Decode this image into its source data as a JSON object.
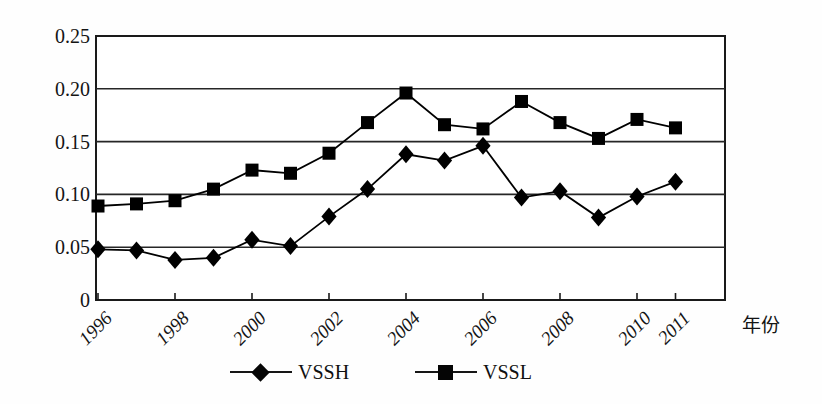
{
  "chart_data": {
    "type": "line",
    "title": "",
    "xlabel": "年份",
    "ylabel": "",
    "x": [
      1996,
      1997,
      1998,
      1999,
      2000,
      2001,
      2002,
      2003,
      2004,
      2005,
      2006,
      2007,
      2008,
      2009,
      2010,
      2011
    ],
    "xtick_labels": [
      "1996",
      "1998",
      "2000",
      "2002",
      "2004",
      "2006",
      "2008",
      "2010",
      "2011"
    ],
    "xtick_values": [
      1996,
      1998,
      2000,
      2002,
      2004,
      2006,
      2008,
      2010,
      2011
    ],
    "ytick_labels": [
      "0",
      "0.05",
      "0.10",
      "0.15",
      "0.20",
      "0.25"
    ],
    "ytick_values": [
      0,
      0.05,
      0.1,
      0.15,
      0.2,
      0.25
    ],
    "xlim": [
      1996,
      1996.75
    ],
    "ylim": [
      0,
      0.25
    ],
    "grid": "horizontal",
    "legend_position": "bottom-center",
    "series": [
      {
        "name": "VSSH",
        "marker": "diamond",
        "color": "#000000",
        "values": [
          0.048,
          0.047,
          0.038,
          0.04,
          0.057,
          0.051,
          0.079,
          0.105,
          0.138,
          0.132,
          0.146,
          0.097,
          0.103,
          0.078,
          0.098,
          0.112
        ]
      },
      {
        "name": "VSSL",
        "marker": "square",
        "color": "#000000",
        "values": [
          0.089,
          0.091,
          0.094,
          0.105,
          0.123,
          0.12,
          0.139,
          0.168,
          0.196,
          0.166,
          0.162,
          0.188,
          0.168,
          0.153,
          0.171,
          0.163
        ]
      }
    ]
  },
  "legend": {
    "entries": [
      {
        "label": "VSSH",
        "marker": "diamond"
      },
      {
        "label": "VSSL",
        "marker": "square"
      }
    ]
  },
  "axis": {
    "x_title": "年份"
  }
}
